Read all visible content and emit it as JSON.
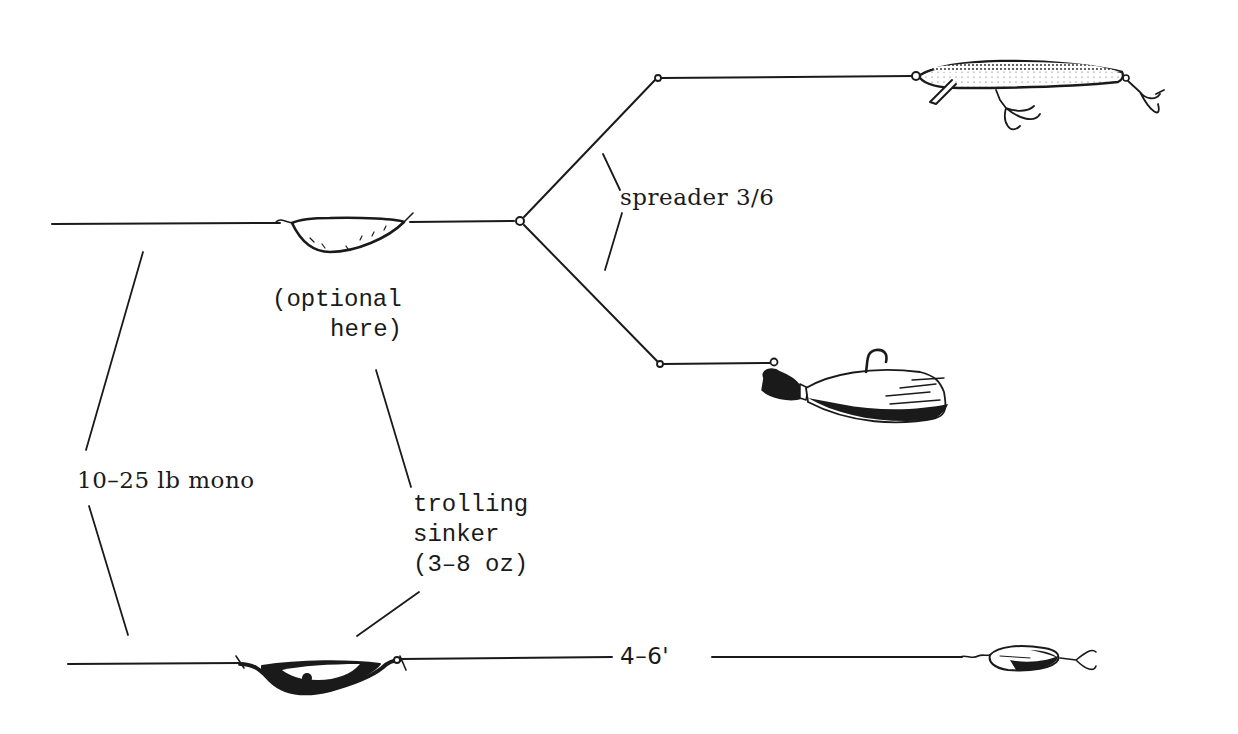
{
  "diagram": {
    "colors": {
      "ink": "#1a1a1a",
      "paper": "#ffffff"
    },
    "labels": {
      "spreader": "spreader 3/6",
      "optional_line1": "(optional",
      "optional_line2": "here)",
      "line_spec": "10–25 lb mono",
      "sinker_line1": "trolling",
      "sinker_line2": "sinker",
      "sinker_line3": "(3–8 oz)",
      "leader_length": "4–6'"
    },
    "components": [
      {
        "id": "main-line-top",
        "type": "line",
        "label": "10–25 lb mono"
      },
      {
        "id": "optional-sinker",
        "type": "trolling-sinker-outline",
        "label": "(optional here)"
      },
      {
        "id": "spreader",
        "type": "wire-spreader",
        "label": "spreader 3/6"
      },
      {
        "id": "crankbait",
        "type": "minnow-plug-lure"
      },
      {
        "id": "bucktail-jig",
        "type": "jig-lure"
      },
      {
        "id": "main-line-bottom",
        "type": "line",
        "label": "10–25 lb mono"
      },
      {
        "id": "trolling-sinker",
        "type": "trolling-sinker",
        "label": "trolling sinker (3–8 oz)"
      },
      {
        "id": "leader",
        "type": "leader",
        "label": "4–6'"
      },
      {
        "id": "spoon",
        "type": "spoon-lure"
      }
    ]
  }
}
